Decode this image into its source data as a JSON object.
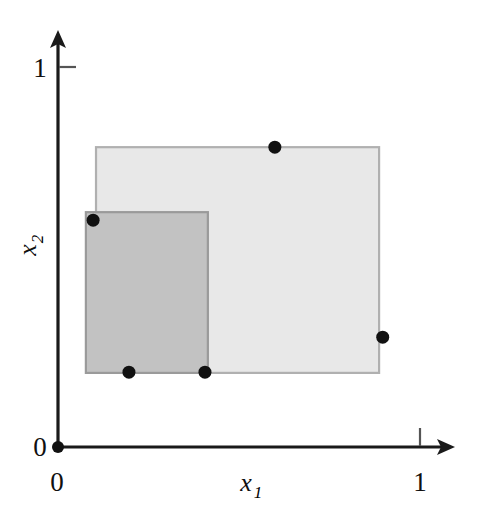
{
  "figure": {
    "title": "",
    "background_color": "#ffffff"
  },
  "axes": {
    "x": {
      "label_main": "x",
      "label_sub": "1",
      "ticks": [
        {
          "value": 0,
          "label": "0"
        },
        {
          "value": 1,
          "label": "1"
        }
      ],
      "range": [
        0,
        1.09
      ]
    },
    "y": {
      "label_main": "x",
      "label_sub": "2",
      "ticks": [
        {
          "value": 0,
          "label": "0"
        },
        {
          "value": 1,
          "label": "1"
        }
      ],
      "range": [
        0,
        1.09
      ]
    },
    "axis_color": "#1a1a1a",
    "tick_color": "#555555"
  },
  "chart_data": {
    "type": "scatter",
    "title": "",
    "xlabel": "x1",
    "ylabel": "x2",
    "xlim": [
      0,
      1.09
    ],
    "ylim": [
      0,
      1.09
    ],
    "grid": false,
    "legend": "none",
    "points": [
      {
        "name": "origin-point",
        "x": 0.0,
        "y": 0.0
      },
      {
        "name": "left-point",
        "x": 0.097,
        "y": 0.597
      },
      {
        "name": "top-point",
        "x": 0.599,
        "y": 0.789
      },
      {
        "name": "right-point",
        "x": 0.897,
        "y": 0.289
      },
      {
        "name": "bottom-left-point",
        "x": 0.196,
        "y": 0.197
      },
      {
        "name": "bottom-right-point",
        "x": 0.406,
        "y": 0.197
      }
    ],
    "point_color": "#111111",
    "point_radius": 6,
    "rectangles": [
      {
        "name": "outer-rectangle",
        "x_min": 0.105,
        "x_max": 0.887,
        "y_min": 0.195,
        "y_max": 0.789,
        "fill": "#e8e8e8",
        "stroke": "#b0b0b0",
        "opacity": 1
      },
      {
        "name": "inner-rectangle",
        "x_min": 0.077,
        "x_max": 0.414,
        "y_min": 0.195,
        "y_max": 0.618,
        "fill": "#c2c2c2",
        "stroke": "#9a9a9a",
        "opacity": 1
      }
    ]
  },
  "geometry": {
    "origin_px": {
      "x": 58,
      "y": 447
    },
    "unit_px": {
      "x": 362,
      "y": 380
    },
    "x_axis_end_px": 455,
    "y_axis_end_px": 31
  }
}
